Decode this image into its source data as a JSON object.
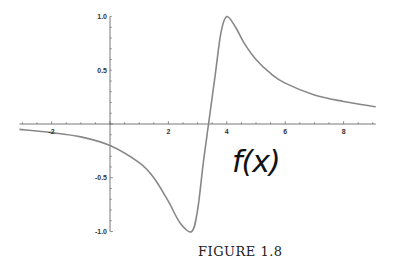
{
  "chart_data": {
    "type": "line",
    "title": "",
    "xlabel": "",
    "ylabel": "",
    "annotation": "f(x)",
    "caption": "FIGURE 1.8",
    "xlim": [
      -3.1,
      9.1
    ],
    "ylim": [
      -1.0,
      1.0
    ],
    "x_ticks": [
      -2,
      2,
      4,
      6,
      8
    ],
    "x_tick_labels": [
      "-2",
      "2",
      "4",
      "6",
      "8"
    ],
    "y_ticks": [
      1.0,
      0.5,
      -0.5,
      -1.0
    ],
    "y_tick_labels": [
      "1.0",
      "0.5",
      "-0.5",
      "-1.0"
    ],
    "grid": false,
    "legend": null,
    "series": [
      {
        "name": "f(x)",
        "color": "#888888",
        "x": [
          -3.1,
          -2,
          -1,
          0,
          1,
          1.5,
          2,
          2.4,
          2.8,
          3.0,
          3.2,
          3.4,
          3.6,
          3.8,
          4.0,
          4.3,
          4.6,
          5,
          5.5,
          6,
          7,
          8,
          9.1
        ],
        "y": [
          -0.05,
          -0.08,
          -0.12,
          -0.2,
          -0.36,
          -0.5,
          -0.72,
          -0.92,
          -1.0,
          -0.8,
          -0.35,
          0.05,
          0.45,
          0.85,
          1.0,
          0.9,
          0.75,
          0.6,
          0.47,
          0.38,
          0.27,
          0.21,
          0.16
        ]
      }
    ]
  },
  "labels": {
    "fx": "f(x)",
    "caption": "FIGURE 1.8"
  },
  "axes": {
    "x_tick_labels": [
      "-2",
      "2",
      "4",
      "6",
      "8"
    ],
    "y_tick_labels": [
      "1.0",
      "0.5",
      "-0.5",
      "-1.0"
    ]
  }
}
